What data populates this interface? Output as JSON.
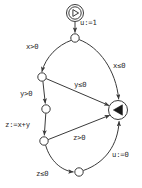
{
  "diagram": {
    "background_color": "#ffffff",
    "line_color": "#3a3a3a",
    "text_color": "#2b2b2b",
    "nodes": [
      {
        "id": "start",
        "kind": "start-node",
        "icon": "play-triangle-right-icon",
        "label": "",
        "cx": 75,
        "cy": 13,
        "r": 8.5
      },
      {
        "id": "n1",
        "kind": "state-node",
        "icon": "",
        "label": "",
        "cx": 75,
        "cy": 38,
        "r": 4.2
      },
      {
        "id": "n2",
        "kind": "state-node",
        "icon": "",
        "label": "",
        "cx": 42,
        "cy": 77,
        "r": 4.2
      },
      {
        "id": "n3",
        "kind": "state-node",
        "icon": "",
        "label": "",
        "cx": 46,
        "cy": 109,
        "r": 4.2
      },
      {
        "id": "n4",
        "kind": "state-node",
        "icon": "",
        "label": "",
        "cx": 44,
        "cy": 141,
        "r": 4.2
      },
      {
        "id": "n5",
        "kind": "state-node",
        "icon": "",
        "label": "",
        "cx": 79,
        "cy": 172,
        "r": 4.2
      },
      {
        "id": "final",
        "kind": "final-node",
        "icon": "play-triangle-left-filled-icon",
        "label": "",
        "cx": 118,
        "cy": 110,
        "r": 9.5
      }
    ],
    "edges": [
      {
        "id": "e_start_n1",
        "from": "start",
        "to": "n1",
        "label": "u:=1",
        "label_x": 80,
        "label_y": 25
      },
      {
        "id": "e_n1_n2",
        "from": "n1",
        "to": "n2",
        "label": "x>0",
        "label_x": 26,
        "label_y": 49
      },
      {
        "id": "e_n1_final",
        "from": "n1",
        "to": "final",
        "label": "x≤0",
        "label_x": 113,
        "label_y": 68
      },
      {
        "id": "e_n2_final",
        "from": "n2",
        "to": "final",
        "label": "y≤0",
        "label_x": 74,
        "label_y": 87
      },
      {
        "id": "e_n2_n3",
        "from": "n2",
        "to": "n3",
        "label": "y>0",
        "label_x": 20,
        "label_y": 96
      },
      {
        "id": "e_n3_n4",
        "from": "n3",
        "to": "n4",
        "label": "z:=x+y",
        "label_x": 5,
        "label_y": 127
      },
      {
        "id": "e_n4_final",
        "from": "n4",
        "to": "final",
        "label": "z>0",
        "label_x": 73,
        "label_y": 140
      },
      {
        "id": "e_n4_n5",
        "from": "n4",
        "to": "n5",
        "label": "z≤0",
        "label_x": 36,
        "label_y": 176
      },
      {
        "id": "e_n5_final",
        "from": "n5",
        "to": "final",
        "label": "u:=0",
        "label_x": 112,
        "label_y": 157
      }
    ]
  }
}
